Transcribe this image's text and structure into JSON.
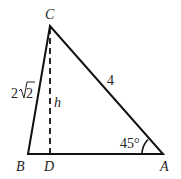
{
  "diagram": {
    "type": "triangle",
    "vertices": {
      "A": {
        "label": "A",
        "x": 163,
        "y": 154
      },
      "B": {
        "label": "B",
        "x": 28,
        "y": 154
      },
      "C": {
        "label": "C",
        "x": 50,
        "y": 26
      },
      "D": {
        "label": "D",
        "x": 50,
        "y": 154
      }
    },
    "labels": {
      "side_BC": "2√2",
      "side_BC_coef": "2",
      "side_BC_rad": "2",
      "side_CA": "4",
      "altitude": "h",
      "angle_A": "45°"
    },
    "colors": {
      "stroke": "#111111",
      "text": "#222222",
      "background": "#ffffff"
    }
  }
}
